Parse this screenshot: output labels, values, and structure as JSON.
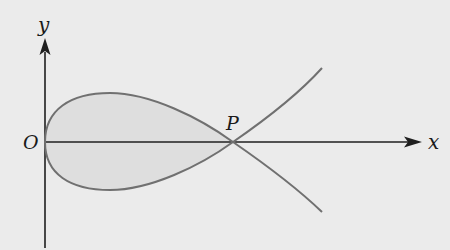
{
  "diagram": {
    "type": "curve-plot",
    "labels": {
      "y_axis": "y",
      "x_axis": "x",
      "origin": "O",
      "point": "P"
    },
    "colors": {
      "background": "#ebebeb",
      "axis": "#1f1f1f",
      "curve": "#707070",
      "region_fill": "#dedede",
      "text": "#1a1a1a"
    },
    "shaded_region": "Enclosed loop between O and P"
  }
}
